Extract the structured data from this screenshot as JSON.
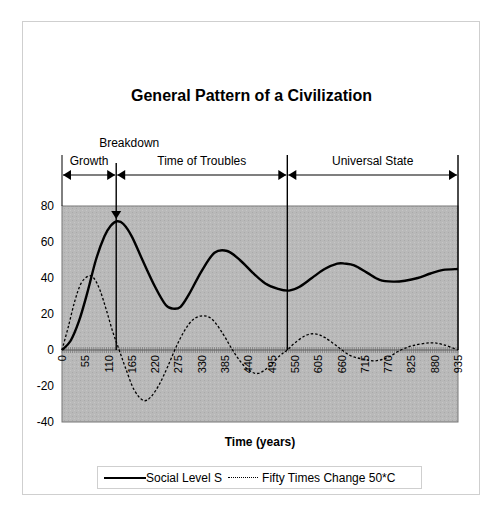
{
  "chart_data": {
    "type": "line",
    "title": "General Pattern of a Civilization",
    "xlabel": "Time (years)",
    "ylabel": "",
    "xlim": [
      0,
      935
    ],
    "ylim": [
      -40,
      80
    ],
    "y_ticks": [
      80,
      60,
      40,
      20,
      0,
      -20,
      -40
    ],
    "x_ticks": [
      0,
      55,
      110,
      165,
      220,
      275,
      330,
      385,
      440,
      495,
      550,
      605,
      660,
      715,
      770,
      825,
      880,
      935
    ],
    "grid": false,
    "plot_background": "#b8b8b8",
    "legend_position": "bottom",
    "legend": [
      "Social Level S",
      "Fifty Times Change 50*C"
    ],
    "series": [
      {
        "name": "Social Level S",
        "style": "solid",
        "color": "#000000",
        "x": [
          0,
          20,
          40,
          60,
          80,
          100,
          115,
          130,
          145,
          165,
          190,
          220,
          245,
          262,
          280,
          300,
          330,
          360,
          390,
          420,
          450,
          480,
          510,
          536,
          560,
          590,
          620,
          650,
          668,
          690,
          720,
          750,
          782,
          810,
          840,
          870,
          900,
          935
        ],
        "values": [
          0,
          5,
          16,
          32,
          50,
          63,
          69,
          71.5,
          70,
          63,
          50,
          35,
          25,
          23,
          24,
          31,
          44,
          54,
          55,
          50,
          43,
          37,
          34,
          33,
          35,
          40,
          45,
          48,
          48,
          47,
          43,
          39,
          38,
          38.5,
          40,
          42.5,
          44.5,
          45
        ]
      },
      {
        "name": "Fifty Times Change 50*C",
        "style": "dashed",
        "color": "#000000",
        "x": [
          0,
          15,
          30,
          45,
          62,
          75,
          90,
          105,
          120,
          135,
          150,
          170,
          192,
          210,
          230,
          250,
          270,
          290,
          310,
          333,
          355,
          380,
          400,
          420,
          440,
          463,
          490,
          515,
          532,
          550,
          575,
          597,
          620,
          650,
          680,
          710,
          740,
          770,
          800,
          830,
          870,
          900,
          935
        ],
        "values": [
          0,
          13,
          27,
          37,
          41,
          40,
          33,
          22,
          10,
          0,
          -10,
          -22,
          -28,
          -26,
          -19,
          -9,
          2,
          11,
          17,
          19,
          17,
          9,
          1,
          -6,
          -11,
          -13,
          -9,
          -3,
          0,
          4,
          8,
          9,
          7,
          2,
          -3,
          -5,
          -6,
          -4,
          0,
          2.5,
          4,
          3,
          0
        ]
      }
    ],
    "annotations": [
      {
        "text": "Growth",
        "x_start": 0,
        "x_end": 128,
        "type": "span-arrow"
      },
      {
        "text": "Time of Troubles",
        "x_start": 128,
        "x_end": 532,
        "type": "span-arrow"
      },
      {
        "text": "Universal State",
        "x_start": 532,
        "x_end": 935,
        "type": "span-arrow"
      },
      {
        "text": "Breakdown",
        "x": 128,
        "type": "down-arrow-marker"
      }
    ]
  },
  "labels": {
    "title": "General Pattern of a Civilization",
    "x_axis_title": "Time (years)",
    "legend_series_1": "Social Level S",
    "legend_series_2": "Fifty Times Change  50*C",
    "phase_growth": "Growth",
    "phase_troubles": "Time of Troubles",
    "phase_universal": "Universal State",
    "breakdown": "Breakdown"
  }
}
